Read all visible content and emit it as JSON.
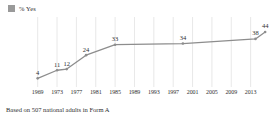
{
  "legend": {
    "swatch_icon": "legend-swatch-icon",
    "label": "% Yes",
    "color": "#9a9a9a"
  },
  "footnote": {
    "text": "Based on 507 national adults in Form A"
  },
  "axis": {
    "ticks": [
      "1969",
      "1973",
      "1977",
      "1981",
      "1985",
      "1989",
      "1993",
      "1997",
      "2001",
      "2005",
      "2009",
      "2013"
    ]
  },
  "chart_data": {
    "type": "line",
    "title": "",
    "subtitle": "",
    "xlabel": "",
    "ylabel": "",
    "legend_position": "top-left",
    "grid": "vertical",
    "line_color": "#8d8d8d",
    "xlim": [
      1967,
      2017
    ],
    "ylim": [
      0,
      50
    ],
    "x": [
      1969,
      1973,
      1975,
      1979,
      1985,
      1999,
      2014,
      2016
    ],
    "values": [
      4,
      11,
      12,
      24,
      33,
      34,
      38,
      44
    ],
    "point_labels": [
      "4",
      "11",
      "12",
      "24",
      "33",
      "34",
      "38",
      "44"
    ],
    "series": [
      {
        "name": "% Yes",
        "x": [
          1969,
          1973,
          1975,
          1979,
          1985,
          1999,
          2014,
          2016
        ],
        "values": [
          4,
          11,
          12,
          24,
          33,
          34,
          38,
          44
        ]
      }
    ],
    "xticks": [
      1969,
      1973,
      1977,
      1981,
      1985,
      1989,
      1993,
      1997,
      2001,
      2005,
      2009,
      2013
    ],
    "xticklabels": [
      "1969",
      "1973",
      "1977",
      "1981",
      "1985",
      "1989",
      "1993",
      "1997",
      "2001",
      "2005",
      "2009",
      "2013"
    ],
    "annotation": "Based on 507 national adults in Form A"
  }
}
